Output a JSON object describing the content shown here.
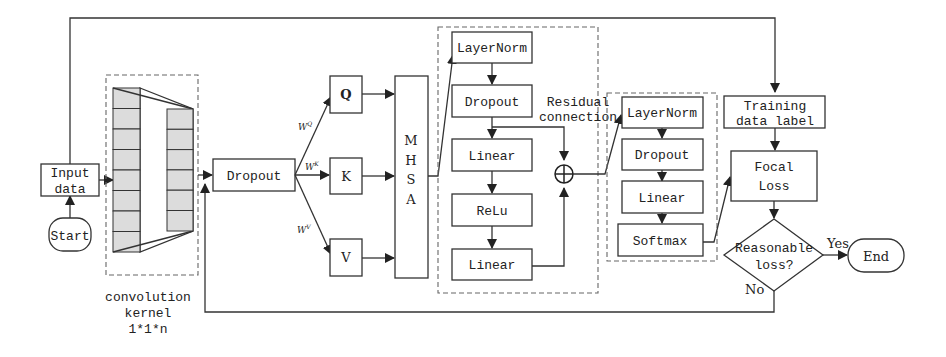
{
  "diagram": {
    "start": "Start",
    "input_line1": "Input",
    "input_line2": "data",
    "conv_label1": "convolution",
    "conv_label2": "kernel",
    "conv_label3": "1*1*n",
    "dropout1": "Dropout",
    "wq": "W",
    "wq_sup": "Q",
    "wk": "W",
    "wk_sup": "K",
    "wv": "W",
    "wv_sup": "V",
    "q": "Q",
    "k": "K",
    "v": "V",
    "mhsa": [
      "M",
      "H",
      "S",
      "A"
    ],
    "ffn": {
      "layernorm": "LayerNorm",
      "dropout": "Dropout",
      "linear1": "Linear",
      "relu": "ReLu",
      "linear2": "Linear"
    },
    "residual1": "Residual",
    "residual2": "connection",
    "head": {
      "layernorm": "LayerNorm",
      "dropout": "Dropout",
      "linear": "Linear",
      "softmax": "Softmax"
    },
    "train_label1": "Training",
    "train_label2": "data label",
    "focal1": "Focal",
    "focal2": "Loss",
    "decision1": "Reasonable",
    "decision2": "loss?",
    "yes": "Yes",
    "no": "No",
    "end": "End"
  }
}
